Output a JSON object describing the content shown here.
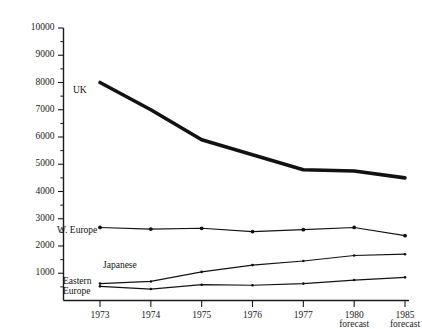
{
  "chart_data": {
    "type": "line",
    "title": "",
    "xlabel": "",
    "ylabel": "",
    "ylim": [
      0,
      10000
    ],
    "grid": false,
    "legend_position": "in-plot-labels",
    "categories": [
      "1973",
      "1974",
      "1975",
      "1976",
      "1977",
      "1980 forecast",
      "1985 forecast"
    ],
    "ytick_labels": [
      "10000",
      "9000",
      "8000",
      "7000",
      "6000",
      "5000",
      "4000",
      "3000",
      "2000",
      "1000"
    ],
    "ytick_values": [
      10000,
      9000,
      8000,
      7000,
      6000,
      5000,
      4000,
      3000,
      2000,
      1000
    ],
    "yminor_step": 500,
    "series": [
      {
        "name": "UK",
        "label": "UK",
        "style": "thick",
        "values": [
          8000,
          7000,
          5900,
          5350,
          4800,
          4750,
          4500
        ]
      },
      {
        "name": "W. Europe",
        "label": "W. Europe",
        "style": "medium",
        "values": [
          2680,
          2620,
          2650,
          2530,
          2600,
          2680,
          2380
        ]
      },
      {
        "name": "Japanese",
        "label": "Japanese",
        "style": "thin",
        "values": [
          620,
          700,
          1050,
          1300,
          1450,
          1650,
          1700
        ]
      },
      {
        "name": "Eastern Europe",
        "label": "Eastern Europe",
        "label_line1": "Eastern",
        "label_line2": "Europe",
        "style": "thin",
        "values": [
          520,
          420,
          580,
          560,
          620,
          750,
          850
        ]
      }
    ],
    "xtick_labels_multiline": [
      {
        "line1": "1973",
        "line2": ""
      },
      {
        "line1": "1974",
        "line2": ""
      },
      {
        "line1": "1975",
        "line2": ""
      },
      {
        "line1": "1976",
        "line2": ""
      },
      {
        "line1": "1977",
        "line2": ""
      },
      {
        "line1": "1980",
        "line2": "forecast"
      },
      {
        "line1": "1985",
        "line2": "forecast"
      }
    ],
    "colors": {
      "line": "#121212",
      "axis": "#1a1a1a",
      "background": "#ffffff",
      "text": "#111111"
    }
  }
}
